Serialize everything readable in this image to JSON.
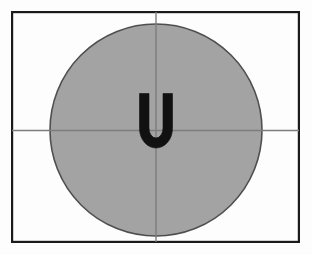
{
  "figure": {
    "canvas": {
      "width": 312,
      "height": 255,
      "background": "#fdfdfd"
    },
    "frame": {
      "name": "outer-border-frame",
      "x": 11,
      "y": 11,
      "width": 289,
      "height": 232,
      "stroke": "#1a1a1a",
      "stroke_width": 2.2,
      "fill": "none"
    },
    "circle": {
      "name": "gray-disc",
      "cx": 156,
      "cy": 130,
      "r": 106,
      "fill": "#a3a3a3",
      "stroke": "#4f4f4f",
      "stroke_width": 1.6
    },
    "crosshair": {
      "color": "#7d7d7d",
      "stroke_width": 1.4,
      "horizontal": {
        "name": "horizontal-crosshair-line",
        "x1": 12,
        "y1": 130,
        "x2": 299,
        "y2": 130
      },
      "vertical": {
        "name": "vertical-crosshair-line",
        "x1": 156,
        "y1": 12,
        "x2": 156,
        "y2": 242
      }
    },
    "letter": {
      "name": "letter-u-glyph",
      "character": "U",
      "color": "#111111",
      "cx": 156,
      "cy": 121,
      "font_size": 78,
      "stroke_width": 10
    }
  }
}
